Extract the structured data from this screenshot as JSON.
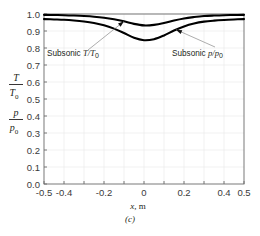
{
  "figure": {
    "caption": "(c)",
    "background": "#ffffff",
    "curve_color": "#000000"
  },
  "chart_data": {
    "type": "line",
    "title": "",
    "subtitle": "",
    "xlabel": "x, m",
    "ylabel_lines": [
      "T/T0",
      "p/p0"
    ],
    "xlim": [
      -0.5,
      0.5
    ],
    "ylim": [
      0.0,
      1.0
    ],
    "grid": true,
    "legend_position": "none",
    "xticks": [
      -0.5,
      -0.4,
      -0.2,
      0,
      0.2,
      0.4,
      0.5
    ],
    "xtick_labels": [
      "-0.5",
      "-0.4",
      "-0.2",
      "0",
      "0.2",
      "0.4",
      "0.5"
    ],
    "yticks": [
      0.0,
      0.1,
      0.2,
      0.3,
      0.4,
      0.5,
      0.6,
      0.7,
      0.8,
      0.9,
      1.0
    ],
    "ytick_labels": [
      "0.0",
      "0.1",
      "0.2",
      "0.3",
      "0.4",
      "0.5",
      "0.6",
      "0.7",
      "0.8",
      "0.9",
      "1.0"
    ],
    "x": [
      -0.5,
      -0.45,
      -0.4,
      -0.35,
      -0.3,
      -0.25,
      -0.2,
      -0.15,
      -0.1,
      -0.05,
      0.0,
      0.05,
      0.1,
      0.15,
      0.2,
      0.25,
      0.3,
      0.35,
      0.4,
      0.45,
      0.5
    ],
    "series": [
      {
        "name": "Subsonic T/T0",
        "label_text": "Subsonic",
        "label_symbol": "T/T",
        "label_sub": "0",
        "values": [
          0.995,
          0.994,
          0.993,
          0.991,
          0.988,
          0.984,
          0.978,
          0.969,
          0.957,
          0.942,
          0.933,
          0.936,
          0.947,
          0.962,
          0.974,
          0.982,
          0.988,
          0.991,
          0.993,
          0.994,
          0.995
        ]
      },
      {
        "name": "Subsonic p/p0",
        "label_text": "Subsonic",
        "label_symbol": "p/p",
        "label_sub": "0",
        "values": [
          0.97,
          0.968,
          0.966,
          0.962,
          0.956,
          0.947,
          0.934,
          0.914,
          0.888,
          0.86,
          0.846,
          0.852,
          0.874,
          0.903,
          0.927,
          0.944,
          0.955,
          0.961,
          0.965,
          0.968,
          0.97
        ]
      }
    ],
    "annotations": [
      {
        "id": "annot-t",
        "text": "Subsonic",
        "symbol": "T/T",
        "subscript": "0",
        "target_x": -0.1,
        "target_y": 0.957
      },
      {
        "id": "annot-p",
        "text": "Subsonic",
        "symbol": "p/p",
        "subscript": "0",
        "target_x": 0.16,
        "target_y": 0.908
      }
    ]
  },
  "axis": {
    "y_frac_top_num": "T",
    "y_frac_top_den": "T",
    "y_frac_top_den_sub": "0",
    "y_frac_bottom_num": "p",
    "y_frac_bottom_den": "p",
    "y_frac_bottom_den_sub": "0",
    "x_axis_symbol": "x",
    "x_axis_unit": ", m"
  }
}
